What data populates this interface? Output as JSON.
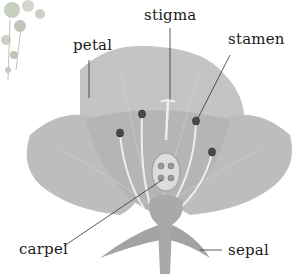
{
  "diagram": {
    "labels": {
      "petal": "petal",
      "stigma": "stigma",
      "stamen": "stamen",
      "carpel": "carpel",
      "sepal": "sepal"
    },
    "colors": {
      "petal": "#c2c2c2",
      "petal_dark": "#a8a8a8",
      "leader": "#333333",
      "text": "#1a1a1a"
    }
  }
}
